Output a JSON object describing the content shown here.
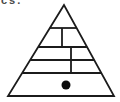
{
  "page": {
    "width": 120,
    "height": 102,
    "background_color": "#ffffff"
  },
  "corner_text": {
    "fragment": "cs."
  },
  "diagram": {
    "type": "pyramid",
    "stroke_color": "#1b1b1b",
    "stroke_width": 1.8,
    "apex": {
      "x": 64,
      "y": 5
    },
    "base_left": {
      "x": 8,
      "y": 96
    },
    "base_right": {
      "x": 114,
      "y": 96
    },
    "horizontal_lines_y": [
      28,
      47,
      60,
      73
    ],
    "vertical_dividers": [
      {
        "x": 62,
        "y1": 28,
        "y2": 47
      },
      {
        "x": 71,
        "y1": 47,
        "y2": 73
      }
    ],
    "dot": {
      "cx": 66,
      "cy": 85,
      "r": 4.5,
      "color": "#0d0d0d"
    }
  }
}
